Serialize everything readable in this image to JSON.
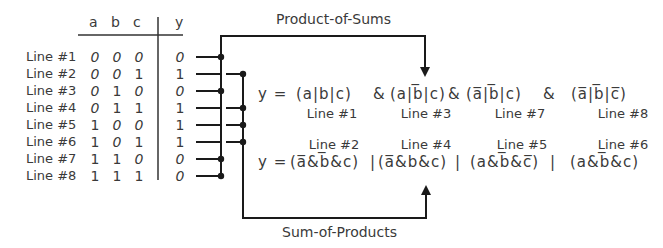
{
  "truth_table": {
    "headers": [
      "a",
      "b",
      "c",
      "y"
    ],
    "rows": [
      {
        "label": "Line #1",
        "a": "0",
        "b": "0",
        "c": "0",
        "y": "0"
      },
      {
        "label": "Line #2",
        "a": "0",
        "b": "0",
        "c": "1",
        "y": "1"
      },
      {
        "label": "Line #3",
        "a": "0",
        "b": "1",
        "c": "0",
        "y": "0"
      },
      {
        "label": "Line #4",
        "a": "0",
        "b": "1",
        "c": "1",
        "y": "1"
      },
      {
        "label": "Line #5",
        "a": "1",
        "b": "0",
        "c": "0",
        "y": "1"
      },
      {
        "label": "Line #6",
        "a": "1",
        "b": "0",
        "c": "1",
        "y": "1"
      },
      {
        "label": "Line #7",
        "a": "1",
        "b": "1",
        "c": "0",
        "y": "0"
      },
      {
        "label": "Line #8",
        "a": "1",
        "b": "1",
        "c": "1",
        "y": "0"
      }
    ]
  },
  "labels": {
    "product_of_sums": "Product-of-Sums",
    "sum_of_products": "Sum-of-Products"
  },
  "pos": {
    "prefix": "y = ",
    "terms": [
      {
        "text": "(a|b|c)",
        "line": "Line #1"
      },
      {
        "text": "(a|b̅|c)",
        "line": "Line #3"
      },
      {
        "text": "(a̅|b̅|c)",
        "line": "Line #7"
      },
      {
        "text": "(a̅|b̅|c̅)",
        "line": "Line #8"
      }
    ],
    "operator": "&"
  },
  "sop": {
    "prefix": "y = ",
    "terms": [
      {
        "text": "(a̅&b̅&c)",
        "line": "Line #2"
      },
      {
        "text": "(a̅&b&c)",
        "line": "Line #4"
      },
      {
        "text": "(a&b̅&c̅)",
        "line": "Line #5"
      },
      {
        "text": "(a&b̅&c)",
        "line": "Line #6"
      }
    ],
    "operator": "|"
  },
  "colors": {
    "ink": "#3a3a3a",
    "wire": "#1a1a1a"
  }
}
